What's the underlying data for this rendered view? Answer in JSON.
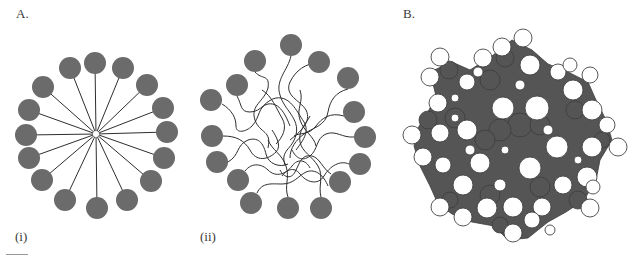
{
  "figure": {
    "panel_a": {
      "label": "A.",
      "sub_i": {
        "label": "(i)",
        "description": "Ordered micelle: 16 gray head-group circles with straight radial tails meeting at a central point",
        "center": [
          96,
          134
        ],
        "head_radius": 11,
        "head_color": "#6b6b6b",
        "heads": [
          [
            95,
            63
          ],
          [
            70,
            68
          ],
          [
            123,
            68
          ],
          [
            43,
            87
          ],
          [
            147,
            85
          ],
          [
            29,
            110
          ],
          [
            163,
            108
          ],
          [
            26,
            135
          ],
          [
            167,
            132
          ],
          [
            29,
            158
          ],
          [
            164,
            158
          ],
          [
            42,
            180
          ],
          [
            151,
            181
          ],
          [
            65,
            200
          ],
          [
            127,
            200
          ],
          [
            97,
            208
          ]
        ]
      },
      "sub_ii": {
        "label": "(ii)",
        "description": "Disordered micelle: 16 gray head-group circles with wavy, tangled tails filling the core",
        "head_radius": 11,
        "head_color": "#6b6b6b",
        "heads": [
          [
            291,
            45
          ],
          [
            255,
            61
          ],
          [
            319,
            62
          ],
          [
            237,
            85
          ],
          [
            348,
            78
          ],
          [
            211,
            100
          ],
          [
            354,
            112
          ],
          [
            212,
            136
          ],
          [
            365,
            137
          ],
          [
            217,
            162
          ],
          [
            360,
            164
          ],
          [
            238,
            180
          ],
          [
            340,
            182
          ],
          [
            251,
            203
          ],
          [
            288,
            208
          ],
          [
            321,
            208
          ]
        ]
      }
    },
    "panel_b": {
      "label": "B.",
      "description": "Space-filling molecular model of a micelle: dark gray core atoms with white surface atoms",
      "dark_color": "#555555",
      "white_atoms": [
        [
          523,
          38,
          9
        ],
        [
          502,
          47,
          9
        ],
        [
          440,
          57,
          9
        ],
        [
          430,
          77,
          9
        ],
        [
          483,
          58,
          9
        ],
        [
          530,
          65,
          10
        ],
        [
          558,
          72,
          8
        ],
        [
          570,
          65,
          7
        ],
        [
          590,
          75,
          8
        ],
        [
          467,
          82,
          8
        ],
        [
          573,
          90,
          10
        ],
        [
          438,
          103,
          9
        ],
        [
          503,
          108,
          11
        ],
        [
          537,
          108,
          12
        ],
        [
          592,
          110,
          10
        ],
        [
          412,
          135,
          9
        ],
        [
          440,
          133,
          9
        ],
        [
          467,
          130,
          10
        ],
        [
          607,
          125,
          8
        ],
        [
          618,
          147,
          9
        ],
        [
          592,
          147,
          10
        ],
        [
          557,
          147,
          11
        ],
        [
          423,
          157,
          9
        ],
        [
          443,
          165,
          8
        ],
        [
          480,
          163,
          10
        ],
        [
          530,
          168,
          11
        ],
        [
          587,
          177,
          10
        ],
        [
          463,
          185,
          10
        ],
        [
          563,
          185,
          9
        ],
        [
          593,
          187,
          7
        ],
        [
          440,
          207,
          9
        ],
        [
          463,
          217,
          9
        ],
        [
          487,
          208,
          10
        ],
        [
          513,
          207,
          10
        ],
        [
          542,
          207,
          9
        ],
        [
          590,
          208,
          9
        ],
        [
          513,
          233,
          9
        ],
        [
          532,
          220,
          8
        ],
        [
          455,
          98,
          4
        ],
        [
          520,
          85,
          5
        ],
        [
          548,
          130,
          5
        ],
        [
          505,
          150,
          4
        ],
        [
          470,
          150,
          5
        ],
        [
          578,
          160,
          4
        ],
        [
          500,
          185,
          6
        ],
        [
          550,
          230,
          5
        ],
        [
          478,
          72,
          5
        ],
        [
          455,
          118,
          4
        ]
      ]
    }
  }
}
